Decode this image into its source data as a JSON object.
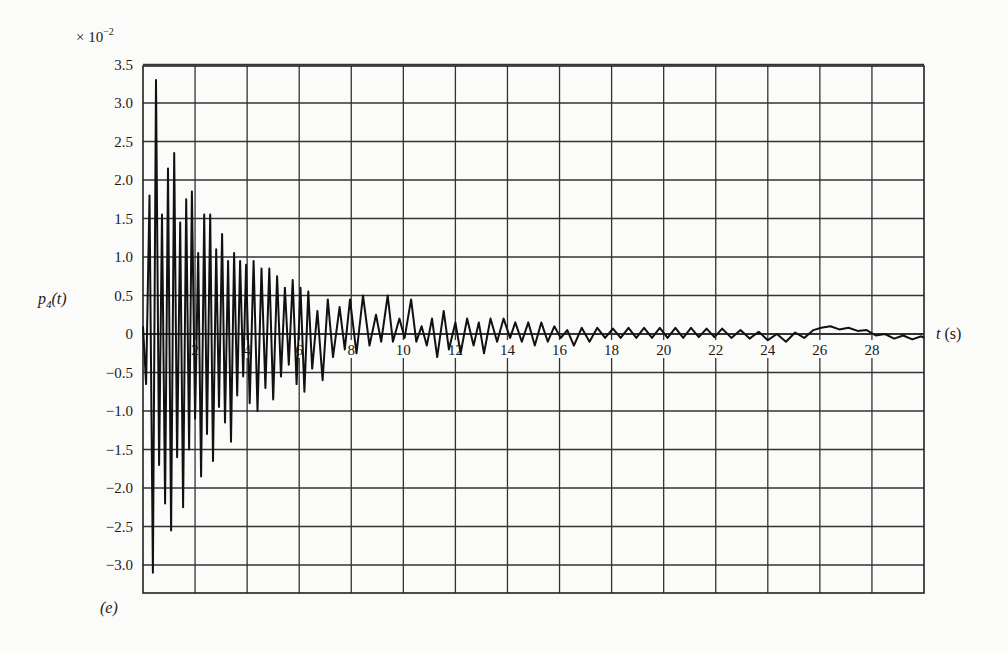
{
  "chart_data": {
    "type": "line",
    "title": "",
    "panel_label": "(e)",
    "xlabel": "t (s)",
    "ylabel": "p4(t)",
    "y_multiplier": "× 10^-2",
    "xlim": [
      0,
      30
    ],
    "ylim": [
      -3.38,
      3.5
    ],
    "grid": true,
    "x_ticks": [
      2,
      4,
      6,
      8,
      10,
      12,
      14,
      16,
      18,
      20,
      22,
      24,
      26,
      28
    ],
    "x_tick_labels": [
      "2",
      "4",
      "6",
      "8",
      "10",
      "12",
      "14",
      "16",
      "18",
      "20",
      "22",
      "24",
      "26",
      "28"
    ],
    "y_ticks": [
      3.5,
      3.0,
      2.5,
      2.0,
      1.5,
      1.0,
      0.5,
      0,
      -0.5,
      -1.0,
      -1.5,
      -2.0,
      -2.5,
      -3.0
    ],
    "y_tick_labels": [
      "3.5",
      "3.0",
      "2.5",
      "2.0",
      "1.5",
      "1.0",
      "0.5",
      "0",
      "−0.5",
      "−1.0",
      "−1.5",
      "−2.0",
      "−2.5",
      "−3.0"
    ],
    "series": [
      {
        "name": "p4(t)",
        "points": [
          [
            0.0,
            0.1
          ],
          [
            0.12,
            -0.65
          ],
          [
            0.25,
            1.8
          ],
          [
            0.38,
            -3.1
          ],
          [
            0.5,
            3.3
          ],
          [
            0.62,
            -1.7
          ],
          [
            0.73,
            1.55
          ],
          [
            0.85,
            -2.2
          ],
          [
            0.96,
            2.15
          ],
          [
            1.08,
            -2.55
          ],
          [
            1.2,
            2.35
          ],
          [
            1.31,
            -1.6
          ],
          [
            1.43,
            1.45
          ],
          [
            1.54,
            -2.25
          ],
          [
            1.66,
            1.75
          ],
          [
            1.77,
            -1.5
          ],
          [
            1.88,
            1.85
          ],
          [
            2.0,
            -1.1
          ],
          [
            2.12,
            1.05
          ],
          [
            2.23,
            -1.85
          ],
          [
            2.35,
            1.55
          ],
          [
            2.46,
            -1.3
          ],
          [
            2.58,
            1.55
          ],
          [
            2.69,
            -1.65
          ],
          [
            2.81,
            1.1
          ],
          [
            2.92,
            -0.95
          ],
          [
            3.04,
            1.3
          ],
          [
            3.15,
            -1.15
          ],
          [
            3.27,
            0.95
          ],
          [
            3.38,
            -1.4
          ],
          [
            3.5,
            1.05
          ],
          [
            3.62,
            -0.8
          ],
          [
            3.73,
            0.95
          ],
          [
            3.85,
            -0.55
          ],
          [
            3.96,
            0.9
          ],
          [
            4.1,
            -0.9
          ],
          [
            4.25,
            0.95
          ],
          [
            4.4,
            -1.0
          ],
          [
            4.55,
            0.85
          ],
          [
            4.7,
            -0.7
          ],
          [
            4.85,
            0.85
          ],
          [
            5.0,
            -0.85
          ],
          [
            5.15,
            0.75
          ],
          [
            5.3,
            -0.55
          ],
          [
            5.45,
            0.6
          ],
          [
            5.6,
            -0.4
          ],
          [
            5.75,
            0.7
          ],
          [
            5.9,
            -0.65
          ],
          [
            6.05,
            0.6
          ],
          [
            6.2,
            -0.75
          ],
          [
            6.35,
            0.55
          ],
          [
            6.5,
            -0.45
          ],
          [
            6.7,
            0.3
          ],
          [
            6.9,
            -0.6
          ],
          [
            7.1,
            0.45
          ],
          [
            7.3,
            -0.3
          ],
          [
            7.55,
            0.35
          ],
          [
            7.75,
            -0.2
          ],
          [
            7.95,
            0.45
          ],
          [
            8.2,
            -0.25
          ],
          [
            8.45,
            0.5
          ],
          [
            8.7,
            -0.15
          ],
          [
            8.95,
            0.25
          ],
          [
            9.15,
            -0.1
          ],
          [
            9.4,
            0.5
          ],
          [
            9.6,
            -0.1
          ],
          [
            9.85,
            0.2
          ],
          [
            10.05,
            -0.05
          ],
          [
            10.3,
            0.45
          ],
          [
            10.5,
            -0.1
          ],
          [
            10.7,
            0.1
          ],
          [
            10.9,
            -0.15
          ],
          [
            11.1,
            0.2
          ],
          [
            11.3,
            -0.3
          ],
          [
            11.55,
            0.3
          ],
          [
            11.75,
            -0.2
          ],
          [
            12.0,
            0.15
          ],
          [
            12.2,
            -0.25
          ],
          [
            12.45,
            0.2
          ],
          [
            12.7,
            -0.15
          ],
          [
            12.9,
            0.15
          ],
          [
            13.1,
            -0.25
          ],
          [
            13.35,
            0.2
          ],
          [
            13.6,
            -0.1
          ],
          [
            13.85,
            0.2
          ],
          [
            14.1,
            -0.05
          ],
          [
            14.3,
            0.15
          ],
          [
            14.55,
            -0.1
          ],
          [
            14.8,
            0.15
          ],
          [
            15.05,
            -0.15
          ],
          [
            15.3,
            0.15
          ],
          [
            15.55,
            -0.1
          ],
          [
            15.8,
            0.1
          ],
          [
            16.05,
            -0.05
          ],
          [
            16.3,
            0.05
          ],
          [
            16.55,
            -0.15
          ],
          [
            16.85,
            0.08
          ],
          [
            17.15,
            -0.1
          ],
          [
            17.45,
            0.08
          ],
          [
            17.75,
            -0.05
          ],
          [
            18.05,
            0.07
          ],
          [
            18.35,
            -0.05
          ],
          [
            18.65,
            0.08
          ],
          [
            18.95,
            -0.05
          ],
          [
            19.25,
            0.08
          ],
          [
            19.55,
            -0.05
          ],
          [
            19.85,
            0.08
          ],
          [
            20.15,
            -0.05
          ],
          [
            20.45,
            0.08
          ],
          [
            20.75,
            -0.05
          ],
          [
            21.05,
            0.08
          ],
          [
            21.35,
            -0.04
          ],
          [
            21.65,
            0.07
          ],
          [
            21.95,
            -0.04
          ],
          [
            22.25,
            0.07
          ],
          [
            22.6,
            -0.05
          ],
          [
            22.95,
            0.05
          ],
          [
            23.3,
            -0.06
          ],
          [
            23.65,
            0.03
          ],
          [
            24.0,
            -0.08
          ],
          [
            24.35,
            0.0
          ],
          [
            24.7,
            -0.1
          ],
          [
            25.05,
            0.02
          ],
          [
            25.4,
            -0.05
          ],
          [
            25.75,
            0.05
          ],
          [
            26.05,
            0.08
          ],
          [
            26.4,
            0.1
          ],
          [
            26.75,
            0.06
          ],
          [
            27.1,
            0.08
          ],
          [
            27.45,
            0.04
          ],
          [
            27.8,
            0.05
          ],
          [
            28.15,
            -0.02
          ],
          [
            28.5,
            0.0
          ],
          [
            28.85,
            -0.06
          ],
          [
            29.2,
            -0.02
          ],
          [
            29.55,
            -0.07
          ],
          [
            29.9,
            -0.03
          ],
          [
            30.0,
            -0.05
          ]
        ]
      }
    ]
  }
}
